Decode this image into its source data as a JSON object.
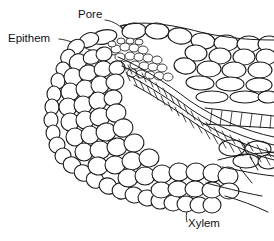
{
  "figure": {
    "kind": "botanical-line-drawing",
    "background_color": "#ffffff",
    "ink_color": "#1a1a1a",
    "width": 274,
    "height": 241,
    "labels": [
      {
        "id": "pore",
        "text": "Pore",
        "x": 78,
        "y": 18,
        "leader": "curved arrow from label down-right to the opening between two surface cells"
      },
      {
        "id": "epithem",
        "text": "Epithem",
        "x": 8,
        "y": 42,
        "leader": "straight line from label right into the dense small-cell cluster"
      },
      {
        "id": "xylem",
        "text": "Xylem",
        "x": 188,
        "y": 227,
        "leader": "hooked line from label up-left into the tracheid strand"
      }
    ],
    "regions": [
      {
        "id": "epidermis",
        "description": "outer layer of rounded cells along the leaf margin"
      },
      {
        "id": "epithem",
        "description": "dense cluster of small thin-walled cells beneath the pore"
      },
      {
        "id": "mesophyll",
        "description": "large oval parenchyma cells filling the leaf body"
      },
      {
        "id": "xylem",
        "description": "elongated scalariform tracheids forming a ladder-patterned strand"
      },
      {
        "id": "pore",
        "description": "water pore opening at the leaf margin surface"
      }
    ]
  }
}
